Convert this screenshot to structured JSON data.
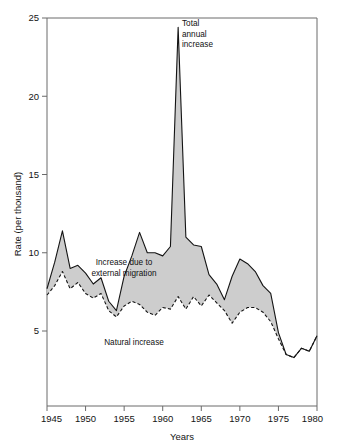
{
  "chart_data": {
    "type": "area",
    "title": "",
    "subtitle": "",
    "xlabel": "Years",
    "ylabel": "Rate (per thousand)",
    "xlim": [
      1945,
      1980
    ],
    "ylim": [
      0,
      25
    ],
    "grid": false,
    "legend_position": "inline-annotations",
    "y_ticks": [
      5,
      10,
      15,
      20,
      25
    ],
    "y_tick_labels": [
      "5",
      "10",
      "15",
      "20",
      "25"
    ],
    "x_ticks": [
      1945,
      1950,
      1955,
      1960,
      1965,
      1970,
      1975,
      1980
    ],
    "x_tick_labels": [
      "1945",
      "1950",
      "1955",
      "1960",
      "1965",
      "1970",
      "1975",
      "1980"
    ],
    "x": [
      1945,
      1946,
      1947,
      1948,
      1949,
      1950,
      1951,
      1952,
      1953,
      1954,
      1955,
      1956,
      1957,
      1958,
      1959,
      1960,
      1961,
      1962,
      1963,
      1964,
      1965,
      1966,
      1967,
      1968,
      1969,
      1970,
      1971,
      1972,
      1973,
      1974,
      1975,
      1976,
      1977,
      1978,
      1979,
      1980
    ],
    "series": [
      {
        "name": "Total annual increase",
        "style": "solid",
        "values": [
          7.7,
          9.4,
          11.4,
          9.0,
          9.2,
          8.7,
          8.0,
          8.4,
          6.9,
          6.3,
          8.5,
          9.8,
          11.3,
          10.0,
          10.0,
          9.8,
          10.4,
          24.4,
          11.0,
          10.5,
          10.4,
          8.6,
          8.0,
          7.0,
          8.5,
          9.6,
          9.3,
          8.8,
          7.9,
          7.4,
          4.9,
          3.5,
          3.3,
          3.9,
          3.7,
          4.7
        ]
      },
      {
        "name": "Natural increase",
        "style": "dashed",
        "values": [
          7.3,
          7.9,
          8.8,
          7.7,
          8.1,
          7.4,
          7.1,
          7.4,
          6.3,
          5.9,
          6.6,
          6.9,
          6.7,
          6.2,
          6.0,
          6.5,
          6.4,
          7.2,
          6.4,
          7.2,
          6.6,
          7.3,
          6.8,
          6.3,
          5.5,
          6.2,
          6.5,
          6.5,
          6.2,
          5.6,
          4.5,
          3.5,
          3.3,
          3.9,
          3.7,
          4.7
        ]
      }
    ],
    "annotations": [
      {
        "name": "total-annual-increase",
        "lines": [
          "Total",
          "annual",
          "increase"
        ],
        "x_px": 182,
        "y_px": 26
      },
      {
        "name": "external-migration",
        "lines": [
          "Increase due to",
          "external migration"
        ],
        "x_px": 124,
        "y_px": 265
      },
      {
        "name": "natural-increase",
        "lines": [
          "Natural increase"
        ],
        "x_px": 134,
        "y_px": 345
      }
    ],
    "colors": {
      "band": "#c9c9c9",
      "line": "#141414",
      "frame": "#6a6a6a",
      "background": "#ffffff"
    }
  }
}
